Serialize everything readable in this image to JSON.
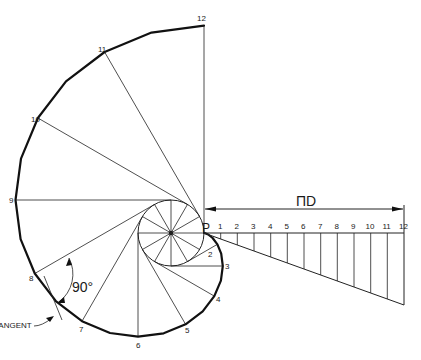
{
  "figure": {
    "point_label": "P",
    "dimension_label": "ΠD",
    "angle_label": "90°",
    "tangent_label": "TANGENT",
    "involute_point_labels": [
      "1",
      "2",
      "3",
      "4",
      "5",
      "6",
      "7",
      "8",
      "9",
      "10",
      "11",
      "12"
    ],
    "unrolled_division_labels": [
      "1",
      "2",
      "3",
      "4",
      "5",
      "6",
      "7",
      "8",
      "9",
      "10",
      "11",
      "12"
    ],
    "divisions": 12,
    "colors": {
      "ink": "#111111",
      "background": "#ffffff"
    }
  }
}
